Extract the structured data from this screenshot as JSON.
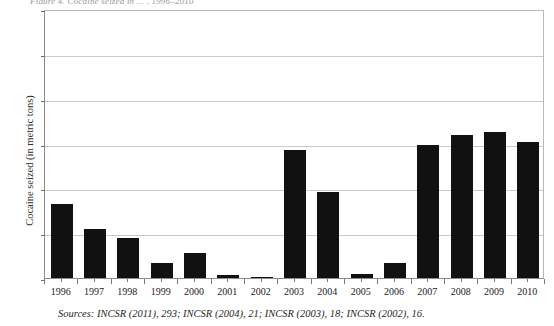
{
  "figure": {
    "title_clipped": "Figure 4.  Cocaine seized in ... , 1996–2010",
    "source_note": "Sources: INCSR (2011), 293; INCSR (2004), 21; INCSR (2003), 18; INCSR (2002), 16.",
    "bar_color": "#111111",
    "gridline_color": "#c9c9c9",
    "axis_color": "#8c8c8c"
  },
  "chart_data": {
    "type": "bar",
    "title": "",
    "xlabel": "",
    "ylabel": "Cocaine seized (in metric tons)",
    "ylim": [
      0,
      12
    ],
    "yticks": [
      0,
      2,
      4,
      6,
      8,
      10,
      12
    ],
    "grid": true,
    "legend": null,
    "categories": [
      "1996",
      "1997",
      "1998",
      "1999",
      "2000",
      "2001",
      "2002",
      "2003",
      "2004",
      "2005",
      "2006",
      "2007",
      "2008",
      "2009",
      "2010"
    ],
    "values": [
      3.3,
      2.2,
      1.8,
      0.65,
      1.1,
      0.15,
      0.05,
      5.7,
      3.85,
      0.2,
      0.65,
      5.95,
      6.4,
      6.5,
      6.05
    ]
  }
}
